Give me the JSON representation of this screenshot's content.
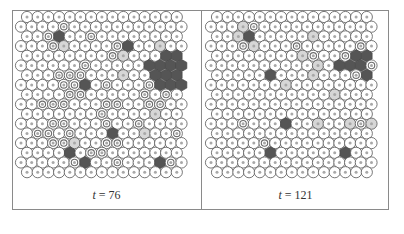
{
  "figure": {
    "panels": [
      {
        "label_var": "t",
        "label_eq": " = ",
        "label_value": "76",
        "grid": [
          "000000000000000",
          "0000100000000000",
          "001300100000000",
          "0001200001300200",
          "000000001200033330",
          "0000001000003333",
          "000111000200333331",
          "0000113010001333",
          "000011000001010000",
          "0011100011001100",
          "000000010000200",
          "0001100010010000",
          "011010003002001300",
          "0001120011000000",
          "000030110000000",
          "0000013001000310",
          "000000000000000"
        ]
      },
      {
        "label_var": "t",
        "label_eq": " = ",
        "label_value": "121",
        "grid": [
          "000000000000000",
          "0002100000000000",
          "002300000200000",
          "0001200010000010",
          "000000002100133300",
          "0000000000203331",
          "000003000200013310",
          "0000000200000000",
          "000000000002000000",
          "0000000000000000",
          "000000000000000",
          "0001000300200212",
          "000000000000000",
          "0000010000000000",
          "000003000000300",
          "0000000000000000",
          "000000000000000"
        ]
      }
    ],
    "colors": {
      "cell_stroke": "#555555",
      "cell_fill": "#ffffff",
      "dot": "#a8a8a8",
      "ring": "#6e6e6e",
      "light_fill": "#d6d6d6",
      "dark_fill": "#555555",
      "frame": "#8a8a8a"
    }
  }
}
